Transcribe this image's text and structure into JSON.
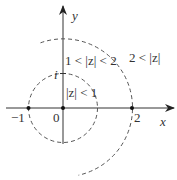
{
  "diagram": {
    "title": "",
    "axes": {
      "x_label": "x",
      "y_label": "y"
    },
    "ticks": {
      "neg_one": "−1",
      "zero": "0",
      "two": "2",
      "i": "i"
    },
    "regions": {
      "inner": "|z| < 1",
      "annulus": "1 < |z| < 2",
      "outer": "2 < |z|"
    },
    "circles": [
      {
        "name": "unit-circle",
        "radius": 1,
        "style": "dashed",
        "full": true
      },
      {
        "name": "radius-two-arc",
        "radius": 2,
        "style": "dashed",
        "full": false
      }
    ],
    "points": [
      "-1",
      "0",
      "2"
    ],
    "colors": {
      "stroke": "#333333",
      "dash": "#555555"
    }
  }
}
